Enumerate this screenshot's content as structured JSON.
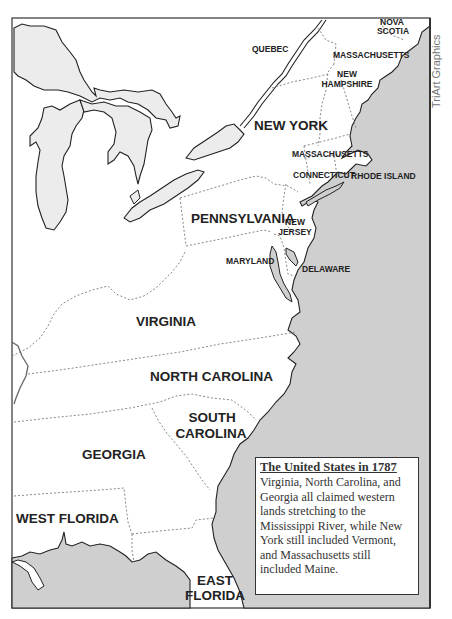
{
  "map": {
    "title": "The United States in 1787",
    "description": "Virginia, North Carolina, and Georgia all claimed western lands stretching to the Mississippi River, while New York still included Vermont, and Massachusetts still included Maine.",
    "credit": "TriArt Graphics",
    "colors": {
      "water": "#cfcfcf",
      "land": "#ffffff",
      "outline": "#222222",
      "border_dotted": "#888888",
      "frame": "#333333"
    },
    "labels": {
      "nova_scotia_1": "NOVA",
      "nova_scotia_2": "SCOTIA",
      "quebec": "QUEBEC",
      "massachusetts_maine": "MASSACHUSETTS",
      "new_hampshire_1": "NEW",
      "new_hampshire_2": "HAMPSHIRE",
      "new_york": "NEW YORK",
      "massachusetts": "MASSACHUSETTS",
      "connecticut": "CONNECTICUT",
      "rhode_island": "RHODE ISLAND",
      "pennsylvania": "PENNSYLVANIA",
      "new_jersey_1": "NEW",
      "new_jersey_2": "JERSEY",
      "maryland": "MARYLAND",
      "delaware": "DELAWARE",
      "virginia": "VIRGINIA",
      "north_carolina": "NORTH CAROLINA",
      "south_carolina_1": "SOUTH",
      "south_carolina_2": "CAROLINA",
      "georgia": "GEORGIA",
      "west_florida": "WEST FLORIDA",
      "east_florida_1": "EAST",
      "east_florida_2": "FLORIDA"
    }
  }
}
